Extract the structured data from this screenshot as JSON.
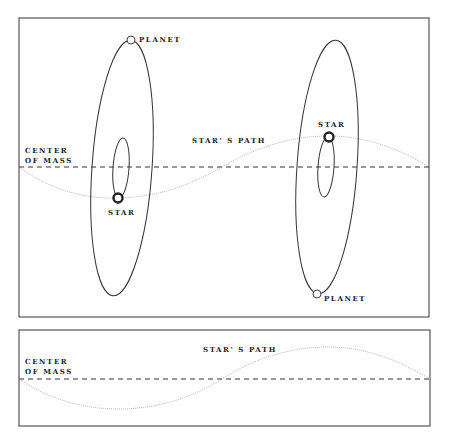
{
  "figure": {
    "type": "radial-velocity orbit diagram",
    "colors": {
      "frame": "#555555",
      "orbit": "#333333",
      "center_line": "#333333",
      "path": "#bbbbbb",
      "star_ring": "#222222",
      "planet": "#444444",
      "text": "#222222"
    }
  },
  "top_panel": {
    "center_of_mass_line1": "CENTER",
    "center_of_mass_line2": "OF MASS",
    "path_label": "STAR' S PATH",
    "left_system": {
      "planet_label": "PLANET",
      "star_label": "STAR"
    },
    "right_system": {
      "planet_label": "PLANET",
      "star_label": "STAR"
    }
  },
  "bottom_panel": {
    "center_of_mass_line1": "CENTER",
    "center_of_mass_line2": "OF MASS",
    "path_label": "STAR' S PATH"
  }
}
